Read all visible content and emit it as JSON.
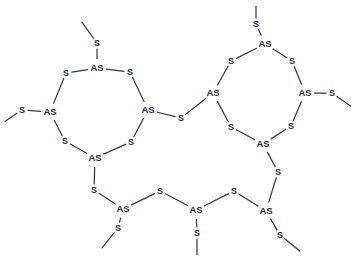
{
  "document": {
    "title": "Arsenic sulfide macrocycle structure diagram",
    "background_color": "#ffffff",
    "bond_color": "#3a3a42",
    "label_color": "#2b2b33"
  },
  "chart_data": {
    "type": "diagram",
    "title": "",
    "subtitle": "",
    "xlabel": "",
    "ylabel": "",
    "notation": "2D skeletal chemical structure",
    "element_labels": [
      "As",
      "S"
    ],
    "counts": {
      "As": 10,
      "S": 18,
      "methyl_stubs": 8
    },
    "atoms": [
      {
        "id": "a1",
        "label": "S",
        "x": 97,
        "y": 43
      },
      {
        "id": "a2",
        "label": "AS",
        "x": 97,
        "y": 68
      },
      {
        "id": "a3",
        "label": "S",
        "x": 66,
        "y": 73
      },
      {
        "id": "a4",
        "label": "S",
        "x": 130,
        "y": 72
      },
      {
        "id": "a5",
        "label": "AS",
        "x": 50,
        "y": 112
      },
      {
        "id": "a6",
        "label": "AS",
        "x": 148,
        "y": 110
      },
      {
        "id": "a7",
        "label": "S",
        "x": 22,
        "y": 110
      },
      {
        "id": "a8",
        "label": "S",
        "x": 65,
        "y": 141
      },
      {
        "id": "a9",
        "label": "S",
        "x": 131,
        "y": 142
      },
      {
        "id": "a10",
        "label": "AS",
        "x": 95,
        "y": 158
      },
      {
        "id": "a11",
        "label": "S",
        "x": 181,
        "y": 118
      },
      {
        "id": "a12",
        "label": "S",
        "x": 256,
        "y": 24
      },
      {
        "id": "a13",
        "label": "AS",
        "x": 265,
        "y": 44
      },
      {
        "id": "a14",
        "label": "S",
        "x": 231,
        "y": 61
      },
      {
        "id": "a15",
        "label": "S",
        "x": 292,
        "y": 61
      },
      {
        "id": "a16",
        "label": "AS",
        "x": 213,
        "y": 93
      },
      {
        "id": "a17",
        "label": "AS",
        "x": 305,
        "y": 93
      },
      {
        "id": "a18",
        "label": "S",
        "x": 332,
        "y": 93
      },
      {
        "id": "a19",
        "label": "S",
        "x": 231,
        "y": 127
      },
      {
        "id": "a20",
        "label": "S",
        "x": 291,
        "y": 126
      },
      {
        "id": "a21",
        "label": "AS",
        "x": 263,
        "y": 144
      },
      {
        "id": "a22",
        "label": "S",
        "x": 278,
        "y": 172
      },
      {
        "id": "a23",
        "label": "S",
        "x": 94,
        "y": 190
      },
      {
        "id": "a24",
        "label": "AS",
        "x": 123,
        "y": 209
      },
      {
        "id": "a25",
        "label": "S",
        "x": 118,
        "y": 228
      },
      {
        "id": "a26",
        "label": "S",
        "x": 160,
        "y": 191
      },
      {
        "id": "a27",
        "label": "AS",
        "x": 196,
        "y": 210
      },
      {
        "id": "a28",
        "label": "S",
        "x": 197,
        "y": 233
      },
      {
        "id": "a29",
        "label": "S",
        "x": 234,
        "y": 191
      },
      {
        "id": "a30",
        "label": "AS",
        "x": 266,
        "y": 211
      },
      {
        "id": "a31",
        "label": "S",
        "x": 280,
        "y": 235
      }
    ],
    "methyl_ends": [
      {
        "id": "m1",
        "from": "a1",
        "x": 81,
        "y": 21
      },
      {
        "id": "m2",
        "from": "a7",
        "x": 4,
        "y": 122
      },
      {
        "id": "m3",
        "from": "a12",
        "x": 256,
        "y": 5
      },
      {
        "id": "m4",
        "from": "a18",
        "x": 352,
        "y": 107
      },
      {
        "id": "m5",
        "from": "a25",
        "x": 101,
        "y": 249
      },
      {
        "id": "m6",
        "from": "a28",
        "x": 197,
        "y": 256
      },
      {
        "id": "m7",
        "from": "a31",
        "x": 301,
        "y": 252
      },
      {
        "id": "m8",
        "from": "a22",
        "x": 278,
        "y": 172
      }
    ],
    "bonds": [
      {
        "from": "a1",
        "to": "m1",
        "kind": "methyl"
      },
      {
        "from": "a1",
        "to": "a2",
        "kind": "ring"
      },
      {
        "from": "a2",
        "to": "a3",
        "kind": "ring"
      },
      {
        "from": "a2",
        "to": "a4",
        "kind": "ring"
      },
      {
        "from": "a3",
        "to": "a5",
        "kind": "ring"
      },
      {
        "from": "a4",
        "to": "a6",
        "kind": "ring"
      },
      {
        "from": "a5",
        "to": "a7",
        "kind": "substituent"
      },
      {
        "from": "a7",
        "to": "m2",
        "kind": "methyl"
      },
      {
        "from": "a5",
        "to": "a8",
        "kind": "ring"
      },
      {
        "from": "a6",
        "to": "a9",
        "kind": "ring"
      },
      {
        "from": "a8",
        "to": "a10",
        "kind": "ring"
      },
      {
        "from": "a9",
        "to": "a10",
        "kind": "ring"
      },
      {
        "from": "a6",
        "to": "a11",
        "kind": "bridge"
      },
      {
        "from": "a11",
        "to": "a16",
        "kind": "bridge"
      },
      {
        "from": "a12",
        "to": "m3",
        "kind": "methyl"
      },
      {
        "from": "a12",
        "to": "a13",
        "kind": "ring"
      },
      {
        "from": "a13",
        "to": "a14",
        "kind": "ring"
      },
      {
        "from": "a13",
        "to": "a15",
        "kind": "ring"
      },
      {
        "from": "a14",
        "to": "a16",
        "kind": "ring"
      },
      {
        "from": "a15",
        "to": "a17",
        "kind": "ring"
      },
      {
        "from": "a17",
        "to": "a18",
        "kind": "substituent"
      },
      {
        "from": "a18",
        "to": "m4",
        "kind": "methyl"
      },
      {
        "from": "a16",
        "to": "a19",
        "kind": "ring"
      },
      {
        "from": "a17",
        "to": "a20",
        "kind": "ring"
      },
      {
        "from": "a19",
        "to": "a21",
        "kind": "ring"
      },
      {
        "from": "a20",
        "to": "a21",
        "kind": "ring"
      },
      {
        "from": "a21",
        "to": "a22",
        "kind": "chain"
      },
      {
        "from": "a22",
        "to": "a30",
        "kind": "chain"
      },
      {
        "from": "a10",
        "to": "a23",
        "kind": "chain"
      },
      {
        "from": "a23",
        "to": "a24",
        "kind": "chain"
      },
      {
        "from": "a24",
        "to": "a25",
        "kind": "substituent"
      },
      {
        "from": "a25",
        "to": "m5",
        "kind": "methyl"
      },
      {
        "from": "a24",
        "to": "a26",
        "kind": "chain"
      },
      {
        "from": "a26",
        "to": "a27",
        "kind": "chain"
      },
      {
        "from": "a27",
        "to": "a28",
        "kind": "substituent"
      },
      {
        "from": "a28",
        "to": "m6",
        "kind": "methyl"
      },
      {
        "from": "a27",
        "to": "a29",
        "kind": "chain"
      },
      {
        "from": "a29",
        "to": "a30",
        "kind": "chain"
      },
      {
        "from": "a30",
        "to": "a31",
        "kind": "substituent"
      },
      {
        "from": "a31",
        "to": "m7",
        "kind": "methyl"
      }
    ],
    "rings": [
      {
        "name": "left-macrocycle",
        "members": [
          "a2",
          "a3",
          "a5",
          "a8",
          "a10",
          "a9",
          "a6",
          "a4"
        ]
      },
      {
        "name": "right-macrocycle",
        "members": [
          "a13",
          "a14",
          "a16",
          "a19",
          "a21",
          "a20",
          "a17",
          "a15"
        ]
      }
    ]
  }
}
